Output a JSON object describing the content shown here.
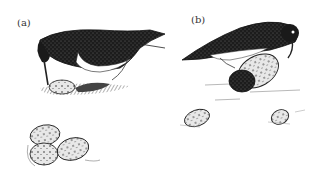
{
  "figure": {
    "panels": [
      {
        "id": "a",
        "label": "(a)"
      },
      {
        "id": "b",
        "label": "(b)"
      }
    ],
    "colors": {
      "background": "#ffffff",
      "ink": "#1a1a1a",
      "shade": "#555555",
      "light": "#bbbbbb"
    }
  }
}
